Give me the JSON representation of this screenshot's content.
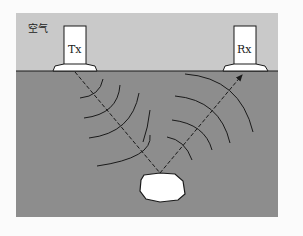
{
  "diagram": {
    "labels": {
      "air": "空气",
      "transmitter": "Tx",
      "receiver": "Rx"
    },
    "colors": {
      "background": "#fbfbfb",
      "air": "#c9c9c9",
      "ground": "#8d8d8d",
      "antenna": "#ffffff",
      "object": "#ffffff",
      "stroke": "#1a1a1a"
    },
    "elements": [
      {
        "id": "air-layer",
        "type": "region"
      },
      {
        "id": "ground-layer",
        "type": "region"
      },
      {
        "id": "transmitter",
        "type": "antenna",
        "label": "Tx"
      },
      {
        "id": "receiver",
        "type": "antenna",
        "label": "Rx"
      },
      {
        "id": "buried-object",
        "type": "target"
      },
      {
        "id": "incident-ray",
        "type": "dashed-line",
        "from": "transmitter",
        "to": "buried-object"
      },
      {
        "id": "reflected-ray",
        "type": "dashed-arrow",
        "from": "buried-object",
        "to": "receiver"
      },
      {
        "id": "transmitted-wavefronts",
        "type": "arcs",
        "count": 4
      },
      {
        "id": "reflected-wavefronts",
        "type": "arcs",
        "count": 5
      }
    ]
  }
}
